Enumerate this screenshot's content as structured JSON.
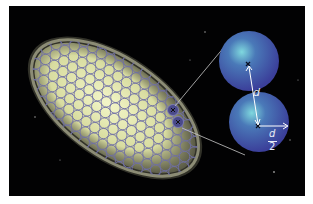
{
  "figure": {
    "background": "#020203",
    "galaxy": {
      "core_color": "#e6edb0",
      "cell_stroke": "#6f6fa6"
    },
    "highlight_cells": {
      "color": "#4a4a8a",
      "marker": "x"
    },
    "zoom_spheres": {
      "color": "#3d4fa8",
      "glow": "#6fd0d8"
    },
    "labels": {
      "distance": "d",
      "radius_num": "d",
      "radius_den": "2"
    }
  }
}
